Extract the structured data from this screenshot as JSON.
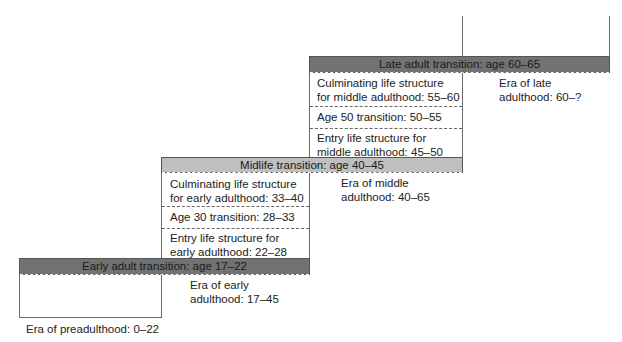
{
  "diagram": {
    "type": "staircase-stages",
    "colors": {
      "transition_dark": "#727272",
      "transition_light": "#bfbfbf",
      "outline": "#6a6a6a",
      "background": "#ffffff"
    },
    "transitions": {
      "early_adult": "Early adult transition: age 17–22",
      "midlife": "Midlife transition: age 40–45",
      "late_adult": "Late adult transition: age 60–65"
    },
    "early_adulthood_stages": {
      "entry": [
        "Entry life structure for",
        "early adulthood: 22–28"
      ],
      "age30": "Age 30 transition: 28–33",
      "culminating": [
        "Culminating life structure",
        "for early adulthood: 33–40"
      ]
    },
    "middle_adulthood_stages": {
      "entry": [
        "Entry life structure for",
        "middle adulthood: 45–50"
      ],
      "age50": "Age 50 transition: 50–55",
      "culminating": [
        "Culminating life structure",
        "for middle adulthood: 55–60"
      ]
    },
    "eras": {
      "preadulthood": "Era of preadulthood: 0–22",
      "early": [
        "Era of early",
        "adulthood: 17–45"
      ],
      "middle": [
        "Era of middle",
        "adulthood: 40–65"
      ],
      "late": [
        "Era of late",
        "adulthood: 60–?"
      ]
    }
  }
}
